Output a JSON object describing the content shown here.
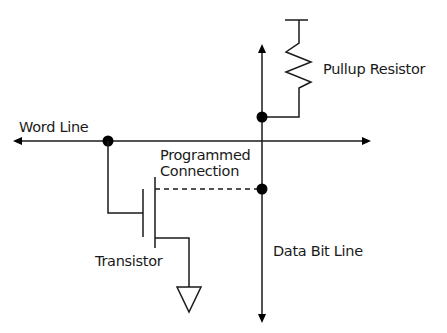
{
  "diagram": {
    "labels": {
      "word_line": "Word Line",
      "pullup_resistor": "Pullup Resistor",
      "programmed_connection_line1": "Programmed",
      "programmed_connection_line2": "Connection",
      "transistor": "Transistor",
      "data_bit_line": "Data Bit Line"
    },
    "components": [
      {
        "id": "word-line",
        "type": "bidirectional-line",
        "orientation": "horizontal"
      },
      {
        "id": "data-bit-line",
        "type": "bidirectional-line",
        "orientation": "vertical"
      },
      {
        "id": "pullup-resistor",
        "type": "resistor",
        "connected_to": "data-bit-line"
      },
      {
        "id": "transistor",
        "type": "mosfet",
        "gate": "word-line",
        "drain": "data-bit-line",
        "source": "ground"
      },
      {
        "id": "programmed-connection",
        "type": "dashed-link",
        "from": "transistor",
        "to": "data-bit-line"
      },
      {
        "id": "ground",
        "type": "ground-symbol"
      }
    ],
    "colors": {
      "line": "#1a1a1a",
      "background": "#ffffff"
    }
  }
}
